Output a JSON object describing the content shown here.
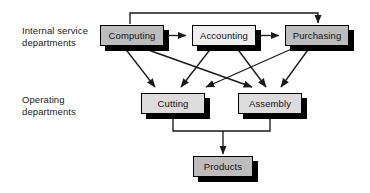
{
  "diagram": {
    "background": "#ffffff",
    "line_color": "#1a1a1a",
    "border_color": "#000000",
    "shadow_color": "#000000",
    "labels": {
      "internal": "Internal service\ndepartments",
      "operating": "Operating\ndepartments"
    },
    "nodes": [
      {
        "id": "computing",
        "label": "Computing",
        "fill": "#bdbdbd",
        "x": 100,
        "y": 25,
        "w": 64,
        "h": 21
      },
      {
        "id": "accounting",
        "label": "Accounting",
        "fill": "#efefef",
        "x": 192,
        "y": 25,
        "w": 64,
        "h": 21
      },
      {
        "id": "purchasing",
        "label": "Purchasing",
        "fill": "#bdbdbd",
        "x": 285,
        "y": 25,
        "w": 64,
        "h": 21
      },
      {
        "id": "cutting",
        "label": "Cutting",
        "fill": "#dcdcdc",
        "x": 141,
        "y": 93,
        "w": 64,
        "h": 21
      },
      {
        "id": "assembly",
        "label": "Assembly",
        "fill": "#dcdcdc",
        "x": 238,
        "y": 93,
        "w": 64,
        "h": 21
      },
      {
        "id": "products",
        "label": "Products",
        "fill": "#bdbdbd",
        "x": 193,
        "y": 156,
        "w": 60,
        "h": 21
      }
    ],
    "edges": [
      {
        "from": "computing",
        "to": "accounting",
        "kind": "horizontal"
      },
      {
        "from": "accounting",
        "to": "purchasing",
        "kind": "horizontal"
      },
      {
        "from": "computing",
        "to": "purchasing",
        "kind": "routed-over-top"
      },
      {
        "from": "computing",
        "to": "cutting",
        "kind": "diagonal"
      },
      {
        "from": "computing",
        "to": "assembly",
        "kind": "diagonal"
      },
      {
        "from": "accounting",
        "to": "cutting",
        "kind": "diagonal"
      },
      {
        "from": "accounting",
        "to": "assembly",
        "kind": "diagonal"
      },
      {
        "from": "purchasing",
        "to": "cutting",
        "kind": "diagonal"
      },
      {
        "from": "purchasing",
        "to": "assembly",
        "kind": "diagonal"
      },
      {
        "from": "cutting",
        "to": "products",
        "kind": "routed-merge"
      },
      {
        "from": "assembly",
        "to": "products",
        "kind": "routed-merge"
      }
    ]
  }
}
